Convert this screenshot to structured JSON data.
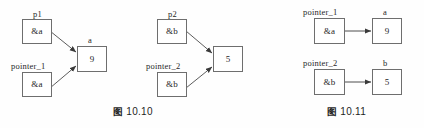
{
  "figure_sheet": {
    "background_color": "#fefefe",
    "line_color": "#6e6e6e",
    "text_color": "#262626"
  },
  "figures": [
    {
      "id": "fig-10-10",
      "caption_cn": "图",
      "caption_num": "10.10",
      "caption_full": "图 10.10",
      "groups": [
        {
          "id": "group-left",
          "pointers": [
            {
              "label": "p1",
              "value": "&a"
            },
            {
              "label": "pointer_1",
              "value": "&a"
            }
          ],
          "target": {
            "label": "a",
            "value": "9"
          }
        },
        {
          "id": "group-middle",
          "pointers": [
            {
              "label": "p2",
              "value": "&b"
            },
            {
              "label": "pointer_2",
              "value": "&b"
            }
          ],
          "target": {
            "label": "",
            "value": "5"
          }
        }
      ]
    },
    {
      "id": "fig-10-11",
      "caption_cn": "图",
      "caption_num": "10.11",
      "caption_full": "图 10.11",
      "rows": [
        {
          "pointer": {
            "label": "pointer_1",
            "value": "&a"
          },
          "target": {
            "label": "a",
            "value": "9"
          }
        },
        {
          "pointer": {
            "label": "pointer_2",
            "value": "&b"
          },
          "target": {
            "label": "b",
            "value": "5"
          }
        }
      ]
    }
  ]
}
